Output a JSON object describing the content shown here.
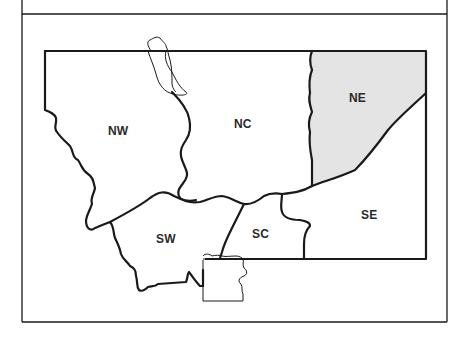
{
  "map": {
    "title": "",
    "colors": {
      "background": "#ffffff",
      "border": "#1a1a1a",
      "highlight_fill": "#e4e4e4",
      "label": "#2a2a2a"
    },
    "regions": [
      {
        "id": "NW",
        "label": "NW",
        "highlighted": false
      },
      {
        "id": "NC",
        "label": "NC",
        "highlighted": false
      },
      {
        "id": "NE",
        "label": "NE",
        "highlighted": true
      },
      {
        "id": "SW",
        "label": "SW",
        "highlighted": false
      },
      {
        "id": "SC",
        "label": "SC",
        "highlighted": false
      },
      {
        "id": "SE",
        "label": "SE",
        "highlighted": false
      }
    ]
  }
}
